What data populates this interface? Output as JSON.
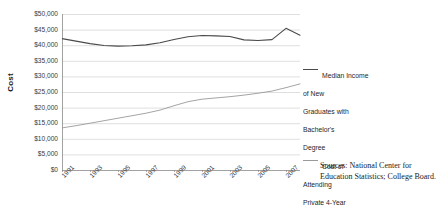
{
  "chart_data": {
    "type": "line",
    "title": "",
    "xlabel": "",
    "ylabel": "Cost",
    "ylim": [
      0,
      50000
    ],
    "ytick_labels": [
      "$50,000",
      "$45,000",
      "$40,000",
      "$35,000",
      "$30,000",
      "$25,000",
      "$20,000",
      "$15,000",
      "$10,000",
      "$5,000",
      "$0"
    ],
    "ytick_values": [
      50000,
      45000,
      40000,
      35000,
      30000,
      25000,
      20000,
      15000,
      10000,
      5000,
      0
    ],
    "grid": true,
    "legend_position": "right",
    "x": [
      1991,
      1992,
      1993,
      1994,
      1995,
      1996,
      1997,
      1998,
      1999,
      2000,
      2001,
      2002,
      2003,
      2004,
      2005,
      2006,
      2007,
      2008
    ],
    "xtick_labels": [
      "1991",
      "1993",
      "1995",
      "1997",
      "1999",
      "2001",
      "2003",
      "2005",
      "2007"
    ],
    "xtick_values": [
      1991,
      1993,
      1995,
      1997,
      1999,
      2001,
      2003,
      2005,
      2007
    ],
    "series": [
      {
        "name": "Median Income of New Graduates with Bachelor's Degree",
        "color": "#4a4a4a",
        "values": [
          42100,
          41300,
          40500,
          39900,
          39700,
          39800,
          40100,
          40800,
          41800,
          42700,
          43100,
          43000,
          42800,
          41700,
          41500,
          41800,
          45400,
          43200
        ]
      },
      {
        "name": "Cost of Attending Private 4-Year University",
        "color": "#9a9a9a",
        "values": [
          13500,
          14200,
          15000,
          15800,
          16600,
          17400,
          18200,
          19200,
          20600,
          21900,
          22700,
          23100,
          23500,
          24000,
          24600,
          25300,
          26400,
          27600
        ]
      }
    ]
  },
  "legend": {
    "items": [
      {
        "label": "Median Income\nof New\nGraduates with\nBachelor's\nDegree",
        "color": "#4a4a4a"
      },
      {
        "label": "Cost of\nAttending\nPrivate 4-Year\nUniversity",
        "color": "#9a9a9a"
      }
    ]
  },
  "source_note": "Sources: National Center for Education Statistics; College Board."
}
